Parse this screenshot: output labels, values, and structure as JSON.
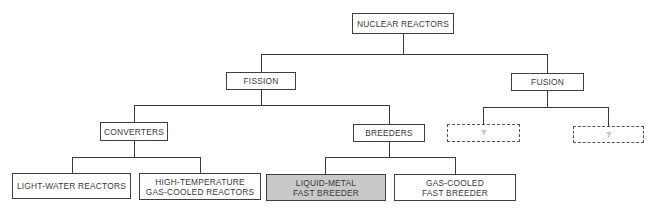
{
  "diagram": {
    "title": "NUCLEAR REACTORS",
    "colors": {
      "line": "#3a3a3a",
      "text": "#3a3a3a",
      "highlight_fill": "#c9c9c9",
      "background": "#ffffff"
    },
    "nodes": {
      "root": {
        "label": "NUCLEAR REACTORS"
      },
      "fission": {
        "label": "FISSION"
      },
      "fusion": {
        "label": "FUSION"
      },
      "converters": {
        "label": "CONVERTERS"
      },
      "breeders": {
        "label": "BREEDERS"
      },
      "fusion_unknown_1": {
        "label": "?",
        "style": "dashed"
      },
      "fusion_unknown_2": {
        "label": "?",
        "style": "dashed"
      },
      "light_water": {
        "label": "LIGHT-WATER REACTORS"
      },
      "htgcr": {
        "label": "HIGH-TEMPERATURE\nGAS-COOLED REACTORS"
      },
      "lmfbr": {
        "label": "LIQUID-METAL\nFAST BREEDER",
        "style": "highlighted"
      },
      "gcfbr": {
        "label": "GAS-COOLED\nFAST BREEDER"
      }
    },
    "edges": [
      [
        "NUCLEAR REACTORS",
        "FISSION"
      ],
      [
        "NUCLEAR REACTORS",
        "FUSION"
      ],
      [
        "FISSION",
        "CONVERTERS"
      ],
      [
        "FISSION",
        "BREEDERS"
      ],
      [
        "FUSION",
        "?"
      ],
      [
        "FUSION",
        "?"
      ],
      [
        "CONVERTERS",
        "LIGHT-WATER REACTORS"
      ],
      [
        "CONVERTERS",
        "HIGH-TEMPERATURE GAS-COOLED REACTORS"
      ],
      [
        "BREEDERS",
        "LIQUID-METAL FAST BREEDER"
      ],
      [
        "BREEDERS",
        "GAS-COOLED FAST BREEDER"
      ]
    ]
  }
}
